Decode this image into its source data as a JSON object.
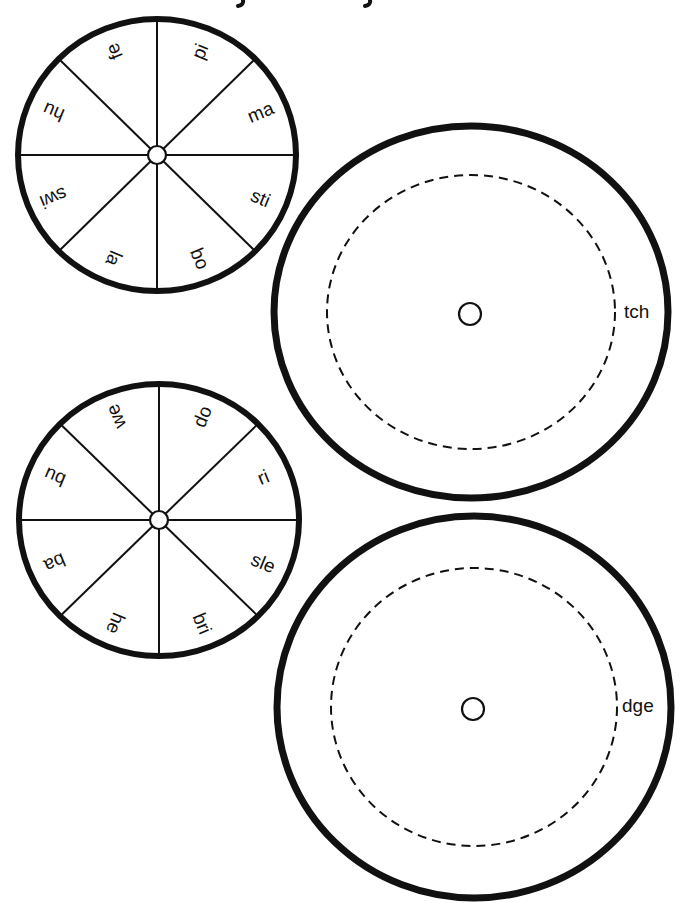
{
  "colors": {
    "ink": "#111111",
    "paper": "#ffffff"
  },
  "small_wheels": [
    {
      "id": "onset-wheel-1",
      "center": [
        157,
        155
      ],
      "rx": 139,
      "ry": 136,
      "stroke_width": 6,
      "hub_radius": 9,
      "label_radius": 112,
      "segments": [
        {
          "label": "pi",
          "angle": -67.5
        },
        {
          "label": "ma",
          "angle": -22.5
        },
        {
          "label": "sti",
          "angle": 22.5
        },
        {
          "label": "bo",
          "angle": 67.5
        },
        {
          "label": "la",
          "angle": 112.5
        },
        {
          "label": "swi",
          "angle": 157.5
        },
        {
          "label": "hu",
          "angle": -157.5
        },
        {
          "label": "fe",
          "angle": -112.5
        }
      ]
    },
    {
      "id": "onset-wheel-2",
      "center": [
        159,
        520
      ],
      "rx": 140,
      "ry": 136,
      "stroke_width": 6,
      "hub_radius": 9,
      "label_radius": 112,
      "segments": [
        {
          "label": "do",
          "angle": -67.5
        },
        {
          "label": "ri",
          "angle": -22.5
        },
        {
          "label": "sle",
          "angle": 22.5
        },
        {
          "label": "bri",
          "angle": 67.5
        },
        {
          "label": "he",
          "angle": 112.5
        },
        {
          "label": "ba",
          "angle": 157.5
        },
        {
          "label": "bu",
          "angle": -157.5
        },
        {
          "label": "we",
          "angle": -112.5
        }
      ]
    }
  ],
  "large_wheels": [
    {
      "id": "ending-wheel-tch",
      "center": [
        471,
        312
      ],
      "rx": 197,
      "ry": 186,
      "stroke_width": 7,
      "dashed_rx": 144,
      "dashed_ry": 137,
      "hole_radius": 11,
      "ending": "tch",
      "ending_pos": [
        624,
        313
      ]
    },
    {
      "id": "ending-wheel-dge",
      "center": [
        474,
        707
      ],
      "rx": 197,
      "ry": 191,
      "stroke_width": 7,
      "dashed_rx": 143,
      "dashed_ry": 139,
      "hole_radius": 11,
      "ending": "dge",
      "ending_pos": [
        622,
        707
      ]
    }
  ]
}
